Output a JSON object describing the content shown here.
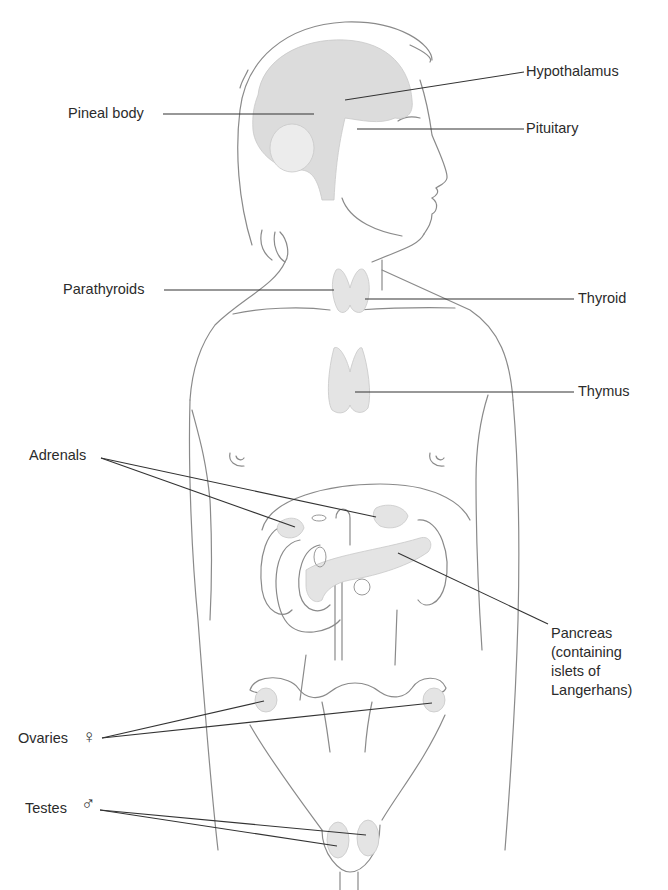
{
  "colors": {
    "outline": "#8a8a8a",
    "leader": "#333333",
    "gland_fill": "#e4e4e4",
    "brain_fill": "#dcdcdc",
    "text": "#2b2b2b"
  },
  "labels": {
    "hypothalamus": "Hypothalamus",
    "pineal": "Pineal body",
    "pituitary": "Pituitary",
    "parathyroids": "Parathyroids",
    "thyroid": "Thyroid",
    "thymus": "Thymus",
    "adrenals": "Adrenals",
    "pancreas": "Pancreas\n(containing\nislets of\nLangerhans)",
    "ovaries": "Ovaries",
    "testes": "Testes"
  },
  "symbols": {
    "female": "♀",
    "male": "♂"
  }
}
